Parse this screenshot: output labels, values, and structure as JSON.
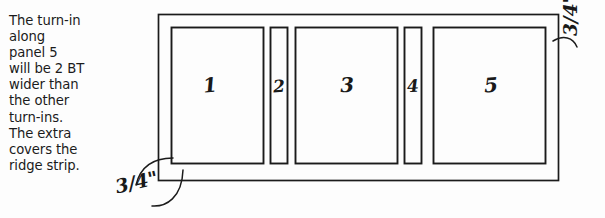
{
  "page": {
    "background_color": "#fdfdfd",
    "ink_color": "#1b1b1b",
    "width": 605,
    "height": 218
  },
  "note": {
    "text": "The turn-in\nalong\npanel 5\nwill be 2 BT\nwider than\nthe other\nturn-ins.\nThe extra\ncovers the\nridge strip.",
    "lines": [
      "The turn-in",
      "along",
      "panel 5",
      "will be 2 BT",
      "wider than",
      "the other",
      "turn-ins.",
      "The extra",
      "covers the",
      "ridge strip."
    ]
  },
  "diagram": {
    "type": "technical-line-drawing",
    "outer_rect": {
      "x": 158,
      "y": 14,
      "width": 401,
      "height": 167
    },
    "panels": [
      {
        "label": "1",
        "x": 171,
        "y": 27,
        "width": 93,
        "height": 137,
        "kind": "wide"
      },
      {
        "label": "2",
        "x": 270,
        "y": 27,
        "width": 18,
        "height": 137,
        "kind": "narrow"
      },
      {
        "label": "3",
        "x": 295,
        "y": 27,
        "width": 103,
        "height": 137,
        "kind": "wide"
      },
      {
        "label": "4",
        "x": 404,
        "y": 27,
        "width": 18,
        "height": 137,
        "kind": "narrow"
      },
      {
        "label": "5",
        "x": 433,
        "y": 27,
        "width": 113,
        "height": 137,
        "kind": "wide"
      }
    ],
    "dimensions": {
      "left": "3/4\"",
      "right": "3/4\" + 2 BT"
    }
  }
}
